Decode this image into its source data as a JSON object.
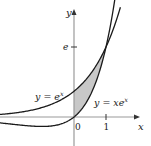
{
  "figure": {
    "type": "area-between-curves",
    "axes": {
      "x_label": "x",
      "y_label": "y",
      "x_ticks": [
        {
          "value": 0,
          "label": "0"
        },
        {
          "value": 1,
          "label": "1"
        }
      ],
      "y_ticks": [
        {
          "value": 2.718,
          "label": "e"
        }
      ]
    },
    "curves": [
      {
        "name": "exp",
        "equation_prefix": "y = e",
        "equation_sup": "x"
      },
      {
        "name": "xexp",
        "equation_prefix": "y = xe",
        "equation_sup": "x"
      }
    ],
    "shaded_region": {
      "from_x": 0,
      "to_x": 1,
      "between": [
        "y = e^x",
        "y = xe^x"
      ],
      "fill": "#c8c8c8"
    },
    "colors": {
      "axis": "#9a9a9a",
      "curve": "#1a1a1a",
      "shade": "#c8c8c8"
    }
  }
}
